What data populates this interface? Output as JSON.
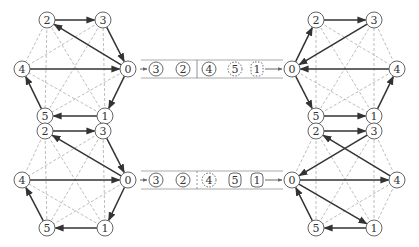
{
  "colors": {
    "solid_edge": "#333333",
    "dashed_edge": "#b5b5b5",
    "node_stroke": "#555555",
    "rail": "#aaaaaa",
    "text": "#333333"
  },
  "graphs": [
    {
      "id": "top-left",
      "nodes": {
        "0": [
          128,
          69
        ],
        "1": [
          105,
          116
        ],
        "2": [
          47,
          20
        ],
        "3": [
          103,
          20
        ],
        "4": [
          22,
          69
        ],
        "5": [
          45,
          116
        ]
      },
      "directed_edges": [
        [
          "2",
          "3"
        ],
        [
          "3",
          "0"
        ],
        [
          "0",
          "2"
        ],
        [
          "4",
          "0"
        ],
        [
          "0",
          "1"
        ],
        [
          "1",
          "5"
        ],
        [
          "5",
          "4"
        ]
      ]
    },
    {
      "id": "top-right",
      "nodes": {
        "0": [
          292,
          69
        ],
        "1": [
          374,
          116
        ],
        "2": [
          316,
          20
        ],
        "3": [
          374,
          20
        ],
        "4": [
          397,
          69
        ],
        "5": [
          316,
          116
        ]
      },
      "directed_edges": [
        [
          "0",
          "2"
        ],
        [
          "2",
          "3"
        ],
        [
          "3",
          "0"
        ],
        [
          "4",
          "0"
        ],
        [
          "0",
          "5"
        ],
        [
          "5",
          "1"
        ],
        [
          "1",
          "4"
        ]
      ]
    },
    {
      "id": "bottom-left",
      "nodes": {
        "0": [
          128,
          180
        ],
        "1": [
          105,
          228
        ],
        "2": [
          45,
          131
        ],
        "3": [
          103,
          131
        ],
        "4": [
          22,
          180
        ],
        "5": [
          47,
          228
        ]
      },
      "directed_edges": [
        [
          "2",
          "3"
        ],
        [
          "3",
          "0"
        ],
        [
          "0",
          "2"
        ],
        [
          "4",
          "0"
        ],
        [
          "0",
          "1"
        ],
        [
          "1",
          "5"
        ],
        [
          "5",
          "4"
        ]
      ]
    },
    {
      "id": "bottom-right",
      "nodes": {
        "0": [
          292,
          180
        ],
        "1": [
          374,
          228
        ],
        "2": [
          316,
          131
        ],
        "3": [
          374,
          131
        ],
        "4": [
          397,
          180
        ],
        "5": [
          316,
          228
        ]
      },
      "directed_edges": [
        [
          "2",
          "3"
        ],
        [
          "3",
          "0"
        ],
        [
          "4",
          "2"
        ],
        [
          "0",
          "4"
        ],
        [
          "0",
          "1"
        ],
        [
          "1",
          "5"
        ],
        [
          "5",
          "0"
        ]
      ]
    }
  ],
  "sequences": [
    {
      "id": "top-sequence",
      "y": 69,
      "divider_style": "solid",
      "items": [
        {
          "label": "3",
          "x": 156,
          "shape": "circle",
          "style": "solid"
        },
        {
          "label": "2",
          "x": 183,
          "shape": "circle",
          "style": "solid"
        },
        {
          "label": "4",
          "x": 209,
          "shape": "circle",
          "style": "solid"
        },
        {
          "label": "5",
          "x": 235,
          "shape": "circle",
          "style": "dashed"
        },
        {
          "label": "1",
          "x": 257,
          "shape": "rounded-rect",
          "style": "dashed"
        }
      ]
    },
    {
      "id": "bottom-sequence",
      "y": 180,
      "divider_style": "dashed",
      "items": [
        {
          "label": "3",
          "x": 156,
          "shape": "circle",
          "style": "solid"
        },
        {
          "label": "2",
          "x": 183,
          "shape": "circle",
          "style": "solid"
        },
        {
          "label": "4",
          "x": 209,
          "shape": "circle",
          "style": "dashed"
        },
        {
          "label": "5",
          "x": 235,
          "shape": "rounded-rect",
          "style": "solid"
        },
        {
          "label": "1",
          "x": 257,
          "shape": "rounded-rect",
          "style": "solid"
        }
      ]
    }
  ]
}
